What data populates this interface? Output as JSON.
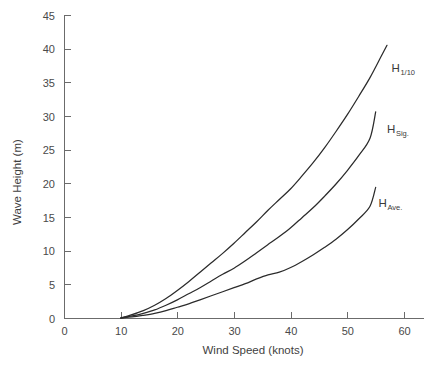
{
  "chart_data": {
    "type": "line",
    "title": "",
    "xlabel": "Wind Speed (knots)",
    "ylabel": "Wave Height (m)",
    "xlim": [
      0,
      64
    ],
    "ylim": [
      0,
      45
    ],
    "xticks": [
      0,
      10,
      20,
      30,
      40,
      50,
      60
    ],
    "xtick_labels": [
      "0",
      "10",
      "20",
      "30",
      "40",
      "50",
      "60"
    ],
    "yticks": [
      0,
      5,
      10,
      15,
      20,
      25,
      30,
      35,
      40,
      45
    ],
    "ytick_labels": [
      "0",
      "5",
      "10",
      "15",
      "20",
      "25",
      "30",
      "35",
      "40",
      "45"
    ],
    "grid": false,
    "legend_position": "inline-right-of-curves",
    "series": [
      {
        "name": "H 1/10",
        "label_main": "H",
        "label_sub": "1/10",
        "label_x": 57.8,
        "label_y": 36.5,
        "x": [
          10,
          12,
          14,
          16,
          18,
          20,
          22,
          24,
          26,
          28,
          30,
          32,
          34,
          36,
          38,
          40,
          42,
          44,
          46,
          48,
          50,
          52,
          54,
          56,
          57
        ],
        "y": [
          0.0,
          0.5,
          1.1,
          1.9,
          2.9,
          4.1,
          5.4,
          6.8,
          8.2,
          9.6,
          11.1,
          12.7,
          14.3,
          16.0,
          17.6,
          19.2,
          21.1,
          23.1,
          25.3,
          27.7,
          30.2,
          32.9,
          35.7,
          38.9,
          40.5
        ]
      },
      {
        "name": "H Sig.",
        "label_main": "H",
        "label_sub": "Sig.",
        "label_x": 57.0,
        "label_y": 27.5,
        "x": [
          10,
          12,
          14,
          16,
          18,
          20,
          22,
          24,
          26,
          28,
          30,
          32,
          34,
          36,
          38,
          40,
          42,
          44,
          46,
          48,
          50,
          52,
          54,
          55
        ],
        "y": [
          0.0,
          0.3,
          0.7,
          1.2,
          1.9,
          2.7,
          3.6,
          4.5,
          5.5,
          6.5,
          7.4,
          8.5,
          9.7,
          10.9,
          12.1,
          13.4,
          14.9,
          16.4,
          18.1,
          19.9,
          21.9,
          24.1,
          26.7,
          30.6
        ]
      },
      {
        "name": "H Ave.",
        "label_main": "H",
        "label_sub": "Ave.",
        "label_x": 55.5,
        "label_y": 16.5,
        "x": [
          10,
          12,
          14,
          16,
          18,
          20,
          22,
          24,
          26,
          28,
          30,
          32,
          34,
          36,
          38,
          40,
          42,
          44,
          46,
          48,
          50,
          52,
          54,
          55
        ],
        "y": [
          0.0,
          0.15,
          0.4,
          0.7,
          1.1,
          1.6,
          2.1,
          2.7,
          3.3,
          3.9,
          4.5,
          5.1,
          5.8,
          6.4,
          6.8,
          7.5,
          8.4,
          9.4,
          10.5,
          11.7,
          13.1,
          14.7,
          16.6,
          19.4
        ]
      }
    ]
  },
  "colors": {
    "background": "#ffffff",
    "axis": "#6b6b6b",
    "curve": "#2b2b2b",
    "text": "#4a4a4a"
  }
}
